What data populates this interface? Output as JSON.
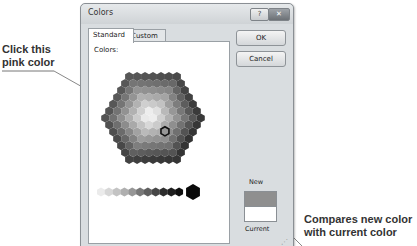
{
  "dialog": {
    "title": "Colors",
    "help_button": "?",
    "close_button": "✕",
    "tabs": [
      {
        "label": "Standard",
        "active": true
      },
      {
        "label": "Custom",
        "active": false
      }
    ],
    "colors_label": "Colors:",
    "buttons": {
      "ok": "OK",
      "cancel": "Cancel"
    },
    "preview": {
      "new_label": "New",
      "current_label": "Current",
      "new_color": "#8f8f8f",
      "current_color": "#ffffff"
    },
    "selected_color": "pink"
  },
  "callouts": {
    "left": [
      "Click this",
      "pink color"
    ],
    "right": [
      "Compares new color",
      "with current color"
    ]
  },
  "icons": {
    "help": "question-icon",
    "close": "close-icon",
    "grip": "resize-grip-icon"
  }
}
